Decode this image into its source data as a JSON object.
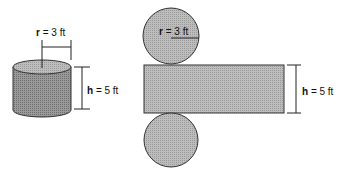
{
  "colors": {
    "background": "#ffffff",
    "stroke": "#333333",
    "cylinder_side": "#8e8e8e",
    "cylinder_top": "#c8c8c8",
    "net_fill": "#c4c4c4"
  },
  "cylinder": {
    "radius_label": {
      "variable": "r",
      "rest": " = 3 ft"
    },
    "height_label": {
      "variable": "h",
      "rest": " = 5 ft"
    }
  },
  "net": {
    "top_circle_label": {
      "variable": "r",
      "rest": " = 3 ft"
    },
    "rect_height_label": {
      "variable": "h",
      "rest": " = 5 ft"
    }
  }
}
